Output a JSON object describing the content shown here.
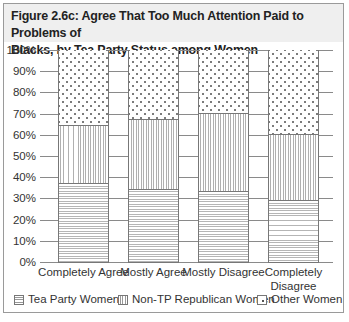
{
  "chart_data": {
    "type": "bar",
    "stacked": true,
    "percent": true,
    "title": "Figure 2.6c: Agree That Too Much Attention Paid to Problems of Blacks, by Tea Party Status among Women",
    "xlabel": "",
    "ylabel": "",
    "ylim": [
      0,
      100
    ],
    "yticks": [
      "0%",
      "10%",
      "20%",
      "30%",
      "40%",
      "50%",
      "60%",
      "70%",
      "80%",
      "90%",
      "100%"
    ],
    "grid": true,
    "legend_position": "bottom",
    "categories": [
      "Completely Agree",
      "Mostly Agree",
      "Mostly Disagree",
      "Completely Disagree"
    ],
    "series": [
      {
        "name": "Tea Party Women",
        "pattern": "horizontal-lines",
        "values": [
          37,
          34,
          33,
          29
        ]
      },
      {
        "name": "Non-TP Republican Women",
        "pattern": "vertical-lines",
        "values": [
          27,
          33,
          37,
          31
        ]
      },
      {
        "name": "Other Women",
        "pattern": "dots",
        "values": [
          36,
          33,
          30,
          40
        ]
      }
    ]
  },
  "title": {
    "line1": "Figure 2.6c: Agree That Too Much Attention Paid to Problems of",
    "line2": "Blacks, by Tea Party Status among Women"
  },
  "yticks": [
    "100%",
    "90%",
    "80%",
    "70%",
    "60%",
    "50%",
    "40%",
    "30%",
    "20%",
    "10%",
    "0%"
  ],
  "xlabels": [
    {
      "line1": "Completely Agree",
      "line2": ""
    },
    {
      "line1": "Mostly Agree",
      "line2": ""
    },
    {
      "line1": "Mostly Disagree",
      "line2": ""
    },
    {
      "line1": "Completely",
      "line2": "Disagree"
    }
  ],
  "legend": [
    {
      "label": "Tea Party Women"
    },
    {
      "label": "Non-TP Republican Women"
    },
    {
      "label": "Other Women"
    }
  ]
}
